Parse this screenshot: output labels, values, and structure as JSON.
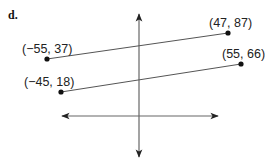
{
  "part_label": "d.",
  "axes": {
    "color": "#555555",
    "horizontal": {
      "x1": 62,
      "x2": 218,
      "y": 116
    },
    "vertical": {
      "x": 139,
      "y1": 14,
      "y2": 157
    }
  },
  "segments": [
    {
      "name": "upper-segment",
      "start": {
        "label": "(−55, 37)",
        "px": [
          47,
          59
        ],
        "label_pos": [
          22,
          42
        ]
      },
      "end": {
        "label": "(47, 87)",
        "px": [
          228,
          33
        ],
        "label_pos": [
          209,
          16
        ]
      }
    },
    {
      "name": "lower-segment",
      "start": {
        "label": "(−45, 18)",
        "px": [
          61,
          92
        ],
        "label_pos": [
          24,
          75
        ]
      },
      "end": {
        "label": "(55, 66)",
        "px": [
          241,
          64
        ],
        "label_pos": [
          222,
          47
        ]
      }
    }
  ],
  "chart_data": {
    "type": "line",
    "title": "d.",
    "series": [
      {
        "name": "segment 1",
        "points": [
          [
            -55,
            37
          ],
          [
            47,
            87
          ]
        ]
      },
      {
        "name": "segment 2",
        "points": [
          [
            -45,
            18
          ],
          [
            55,
            66
          ]
        ]
      }
    ],
    "xlabel": "",
    "ylabel": "",
    "grid": false
  }
}
